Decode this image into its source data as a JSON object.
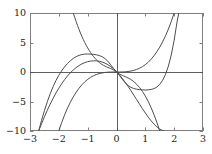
{
  "chart_data": {
    "type": "line",
    "title": "",
    "subtitle": "",
    "xlabel": "",
    "ylabel": "",
    "xlim": [
      -3,
      3
    ],
    "ylim": [
      -10,
      10
    ],
    "xticks": [
      -3,
      -2,
      -1,
      0,
      1,
      2,
      3
    ],
    "xtick_labels": [
      "−3",
      "−2",
      "−1",
      "0",
      "1",
      "2",
      "3"
    ],
    "yticks": [
      -10,
      -5,
      0,
      5,
      10
    ],
    "ytick_labels": [
      "−10",
      "−5",
      "0",
      "5",
      "10"
    ],
    "grid": false,
    "legend": "none",
    "axis_lines": {
      "x_axis_at_y": 0,
      "y_axis_at_x": 0,
      "color": "#4d4d4d"
    },
    "frame_color": "#808080",
    "curve_color": "#4d4d4d",
    "curve_width": 1.0,
    "series": [
      {
        "name": "curve-1",
        "description": "cubic with local maximum near (-1, 3) and local minimum near (1.2, -3), passing through origin",
        "points": [
          [
            -2.7,
            -10.0
          ],
          [
            -2.6,
            -8.77
          ],
          [
            -2.5,
            -7.6
          ],
          [
            -2.4,
            -6.49
          ],
          [
            -2.3,
            -5.45
          ],
          [
            -2.2,
            -4.48
          ],
          [
            -2.1,
            -3.57
          ],
          [
            -2.0,
            -2.74
          ],
          [
            -1.9,
            -1.98
          ],
          [
            -1.8,
            -1.29
          ],
          [
            -1.7,
            -0.67
          ],
          [
            -1.6,
            -0.13
          ],
          [
            -1.5,
            0.34
          ],
          [
            -1.4,
            0.75
          ],
          [
            -1.3,
            1.09
          ],
          [
            -1.2,
            1.37
          ],
          [
            -1.1,
            1.59
          ],
          [
            -1.0,
            1.75
          ],
          [
            -0.9,
            1.85
          ],
          [
            -0.8,
            1.9
          ],
          [
            -0.7,
            1.89
          ],
          [
            -0.6,
            1.82
          ],
          [
            -0.5,
            1.69
          ],
          [
            -0.4,
            1.5
          ],
          [
            -0.3,
            1.24
          ],
          [
            -0.2,
            0.92
          ],
          [
            -0.1,
            0.52
          ],
          [
            0.0,
            0.05
          ],
          [
            0.1,
            -0.48
          ],
          [
            0.2,
            -1.08
          ],
          [
            0.3,
            -1.73
          ],
          [
            0.4,
            -2.43
          ],
          [
            0.5,
            -3.16
          ],
          [
            0.6,
            -3.92
          ],
          [
            0.7,
            -4.69
          ],
          [
            0.8,
            -5.46
          ],
          [
            0.9,
            -6.22
          ],
          [
            1.0,
            -6.95
          ],
          [
            1.1,
            -7.64
          ],
          [
            1.2,
            -8.27
          ],
          [
            1.3,
            -8.83
          ],
          [
            1.4,
            -9.3
          ],
          [
            1.5,
            -9.67
          ],
          [
            1.6,
            -9.92
          ],
          [
            1.65,
            -10.0
          ]
        ]
      },
      {
        "name": "curve-2",
        "description": "rising cubic from lower-left through origin, steeply increasing on the right",
        "points": [
          [
            -2.0,
            -10.0
          ],
          [
            -1.9,
            -8.56
          ],
          [
            -1.8,
            -7.27
          ],
          [
            -1.7,
            -6.13
          ],
          [
            -1.6,
            -5.12
          ],
          [
            -1.5,
            -4.22
          ],
          [
            -1.4,
            -3.44
          ],
          [
            -1.3,
            -2.75
          ],
          [
            -1.2,
            -2.16
          ],
          [
            -1.1,
            -1.66
          ],
          [
            -1.0,
            -1.25
          ],
          [
            -0.9,
            -0.91
          ],
          [
            -0.8,
            -0.64
          ],
          [
            -0.7,
            -0.43
          ],
          [
            -0.6,
            -0.27
          ],
          [
            -0.5,
            -0.16
          ],
          [
            -0.4,
            -0.08
          ],
          [
            -0.3,
            -0.03
          ],
          [
            -0.2,
            -0.01
          ],
          [
            -0.1,
            0.0
          ],
          [
            0.0,
            0.0
          ],
          [
            0.1,
            0.0
          ],
          [
            0.2,
            0.01
          ],
          [
            0.3,
            0.03
          ],
          [
            0.4,
            0.08
          ],
          [
            0.5,
            0.16
          ],
          [
            0.6,
            0.27
          ],
          [
            0.7,
            0.43
          ],
          [
            0.8,
            0.64
          ],
          [
            0.9,
            0.91
          ],
          [
            1.0,
            1.25
          ],
          [
            1.1,
            1.66
          ],
          [
            1.2,
            2.16
          ],
          [
            1.3,
            2.75
          ],
          [
            1.4,
            3.44
          ],
          [
            1.5,
            4.22
          ],
          [
            1.6,
            5.12
          ],
          [
            1.7,
            6.13
          ],
          [
            1.8,
            7.27
          ],
          [
            1.9,
            8.56
          ],
          [
            2.0,
            10.0
          ]
        ]
      },
      {
        "name": "curve-3",
        "description": "descending cubic entering from top-left, inflecting at origin, exiting at bottom-right",
        "points": [
          [
            -1.5,
            10.0
          ],
          [
            -1.45,
            9.25
          ],
          [
            -1.4,
            8.54
          ],
          [
            -1.35,
            7.86
          ],
          [
            -1.3,
            7.22
          ],
          [
            -1.25,
            6.61
          ],
          [
            -1.2,
            6.04
          ],
          [
            -1.15,
            5.5
          ],
          [
            -1.1,
            4.99
          ],
          [
            -1.05,
            4.52
          ],
          [
            -1.0,
            4.08
          ],
          [
            -0.95,
            3.68
          ],
          [
            -0.9,
            3.3
          ],
          [
            -0.85,
            2.95
          ],
          [
            -0.8,
            2.63
          ],
          [
            -0.75,
            2.34
          ],
          [
            -0.7,
            2.08
          ],
          [
            -0.65,
            1.84
          ],
          [
            -0.6,
            1.63
          ],
          [
            -0.55,
            1.44
          ],
          [
            -0.5,
            1.27
          ],
          [
            -0.45,
            1.13
          ],
          [
            -0.4,
            1.0
          ],
          [
            -0.35,
            0.88
          ],
          [
            -0.3,
            0.77
          ],
          [
            -0.25,
            0.67
          ],
          [
            -0.2,
            0.57
          ],
          [
            -0.15,
            0.46
          ],
          [
            -0.1,
            0.33
          ],
          [
            -0.05,
            0.17
          ],
          [
            0.0,
            0.0
          ],
          [
            0.05,
            -0.17
          ],
          [
            0.1,
            -0.33
          ],
          [
            0.15,
            -0.46
          ],
          [
            0.2,
            -0.57
          ],
          [
            0.25,
            -0.67
          ],
          [
            0.3,
            -0.77
          ],
          [
            0.4,
            -1.0
          ],
          [
            0.5,
            -1.27
          ],
          [
            0.6,
            -1.63
          ],
          [
            0.7,
            -2.08
          ],
          [
            0.8,
            -2.63
          ],
          [
            0.9,
            -3.3
          ],
          [
            1.0,
            -4.08
          ],
          [
            1.1,
            -4.99
          ],
          [
            1.2,
            -6.04
          ],
          [
            1.3,
            -7.22
          ],
          [
            1.4,
            -8.54
          ],
          [
            1.5,
            -10.0
          ]
        ]
      },
      {
        "name": "curve-4",
        "description": "flat-topped quintic: plateau near y=3 around x=-1, saddle at origin, plateau near y=-3 around x=1.2, rising steeply after x=1.8",
        "points": [
          [
            -2.7,
            -10.0
          ],
          [
            -2.6,
            -8.2
          ],
          [
            -2.5,
            -6.55
          ],
          [
            -2.4,
            -5.05
          ],
          [
            -2.3,
            -3.7
          ],
          [
            -2.2,
            -2.5
          ],
          [
            -2.1,
            -1.45
          ],
          [
            -2.0,
            -0.55
          ],
          [
            -1.9,
            0.22
          ],
          [
            -1.8,
            0.88
          ],
          [
            -1.7,
            1.44
          ],
          [
            -1.6,
            1.91
          ],
          [
            -1.5,
            2.3
          ],
          [
            -1.4,
            2.6
          ],
          [
            -1.3,
            2.82
          ],
          [
            -1.2,
            2.96
          ],
          [
            -1.1,
            3.03
          ],
          [
            -1.0,
            3.05
          ],
          [
            -0.9,
            3.03
          ],
          [
            -0.8,
            2.99
          ],
          [
            -0.7,
            2.92
          ],
          [
            -0.6,
            2.8
          ],
          [
            -0.5,
            2.6
          ],
          [
            -0.4,
            2.28
          ],
          [
            -0.3,
            1.82
          ],
          [
            -0.2,
            1.22
          ],
          [
            -0.1,
            0.58
          ],
          [
            0.0,
            0.0
          ],
          [
            0.1,
            -0.58
          ],
          [
            0.2,
            -1.22
          ],
          [
            0.3,
            -1.82
          ],
          [
            0.4,
            -2.28
          ],
          [
            0.5,
            -2.6
          ],
          [
            0.6,
            -2.8
          ],
          [
            0.7,
            -2.92
          ],
          [
            0.8,
            -2.99
          ],
          [
            0.9,
            -3.03
          ],
          [
            1.0,
            -3.05
          ],
          [
            1.1,
            -3.03
          ],
          [
            1.2,
            -2.96
          ],
          [
            1.3,
            -2.82
          ],
          [
            1.4,
            -2.55
          ],
          [
            1.5,
            -2.1
          ],
          [
            1.6,
            -1.4
          ],
          [
            1.7,
            -0.4
          ],
          [
            1.8,
            1.0
          ],
          [
            1.9,
            2.9
          ],
          [
            2.0,
            5.4
          ],
          [
            2.1,
            8.5
          ],
          [
            2.16,
            10.0
          ]
        ]
      }
    ]
  },
  "axes": {
    "plot_left_px": 30,
    "plot_top_px": 13,
    "plot_right_px": 203,
    "plot_bottom_px": 131
  }
}
